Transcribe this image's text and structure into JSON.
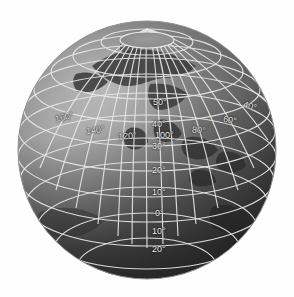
{
  "figure": {
    "kind": "orthographic-globe",
    "background_color": "#ffffff",
    "graticule_color": "#e8e8e8",
    "ocean_color": "#7a7a7a",
    "land_color": "#3a3a3a",
    "label_color": "#f2f2f2",
    "grid_interval_degrees": 10,
    "center_longitude_label": "100°",
    "pole_visible": "north"
  },
  "labels": {
    "latitudes": [
      {
        "text": "50°",
        "x": 153,
        "y": 98
      },
      {
        "text": "40°",
        "x": 152,
        "y": 120
      },
      {
        "text": "30°",
        "x": 152,
        "y": 142
      },
      {
        "text": "20°",
        "x": 152,
        "y": 166
      },
      {
        "text": "10°",
        "x": 152,
        "y": 188
      },
      {
        "text": "0°",
        "x": 155,
        "y": 209
      },
      {
        "text": "10°",
        "x": 152,
        "y": 227
      },
      {
        "text": "20°",
        "x": 152,
        "y": 245
      }
    ],
    "longitudes": [
      {
        "text": "160°",
        "x": 55,
        "y": 113
      },
      {
        "text": "140°",
        "x": 86,
        "y": 126
      },
      {
        "text": "120°",
        "x": 118,
        "y": 132
      },
      {
        "text": "100°",
        "x": 155,
        "y": 131
      },
      {
        "text": "80°",
        "x": 192,
        "y": 126
      },
      {
        "text": "60°",
        "x": 223,
        "y": 116
      },
      {
        "text": "40°",
        "x": 243,
        "y": 102
      }
    ]
  }
}
